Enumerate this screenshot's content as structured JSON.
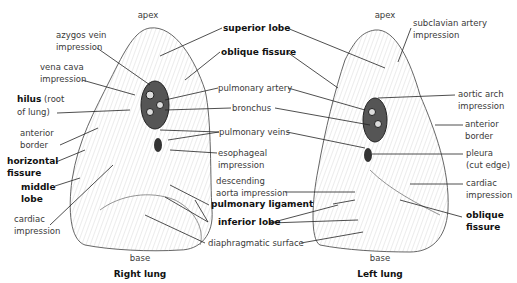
{
  "right_lung": {
    "title": "Right lung",
    "apex": "apex",
    "base": "base",
    "labels": {
      "azygos": [
        "azygos vein",
        "impression"
      ],
      "vena_cava": [
        "vena cava",
        "impression"
      ],
      "hilus": [
        "hilus",
        "(root",
        "of lung)"
      ],
      "anterior_border": [
        "anterior",
        "border"
      ],
      "horizontal_fissure": [
        "horizontal",
        "fissure"
      ],
      "middle_lobe": [
        "middle",
        "lobe"
      ],
      "cardiac": [
        "cardiac",
        "impression"
      ]
    }
  },
  "shared_labels": {
    "superior_lobe": "superior lobe",
    "oblique_fissure": "oblique fissure",
    "pulmonary_artery": "pulmonary artery",
    "bronchus": "bronchus",
    "pulmonary_veins": "pulmonary veins",
    "esophageal": [
      "esophageal",
      "impression"
    ],
    "desc_aorta": [
      "descending",
      "aorta impression"
    ],
    "pulmonary_ligament": "pulmonary ligament",
    "inferior_lobe": "inferior lobe",
    "diaphragmatic": "diaphragmatic surface"
  },
  "left_lung": {
    "title": "Left lung",
    "apex": "apex",
    "base": "base",
    "labels": {
      "subclavian": [
        "subclavian artery",
        "impression"
      ],
      "aortic_arch": [
        "aortic arch",
        "impression"
      ],
      "anterior_border": [
        "anterior",
        "border"
      ],
      "pleura": [
        "pleura",
        "(cut edge)"
      ],
      "cardiac": [
        "cardiac",
        "impression"
      ],
      "oblique_fissure": [
        "oblique",
        "fissure"
      ]
    }
  }
}
